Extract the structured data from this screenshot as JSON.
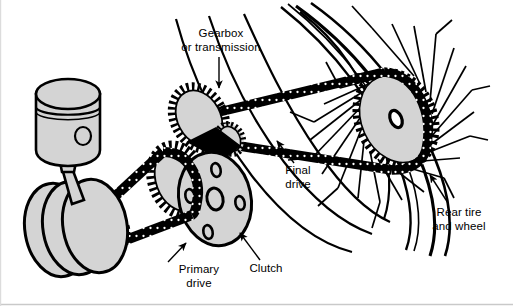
{
  "figure": {
    "background_color": "#ffffff",
    "line_color": "#000000",
    "part_fill_color": "#d4d4d4",
    "chain_color": "#000000"
  },
  "labels": {
    "gearbox": {
      "line1": "Gearbox",
      "line2": "or transmission"
    },
    "final_drive": {
      "line1": "Final",
      "line2": "drive"
    },
    "rear_wheel": {
      "line1": "Rear tire",
      "line2": "and wheel"
    },
    "clutch": {
      "line1": "Clutch"
    },
    "primary_drive": {
      "line1": "Primary",
      "line2": "drive"
    }
  },
  "components": [
    {
      "name": "piston",
      "description": "Engine piston with ring groove and wrist pin hole"
    },
    {
      "name": "connecting-rod",
      "description": "Connecting rod joining piston to crankshaft"
    },
    {
      "name": "flywheel-assembly",
      "description": "Crankshaft flywheels, three stacked discs"
    },
    {
      "name": "engine-sprocket",
      "description": "Small toothed engine output sprocket"
    },
    {
      "name": "primary-chain",
      "description": "Primary drive chain from engine sprocket to clutch"
    },
    {
      "name": "clutch-disc",
      "description": "Clutch plate with centre hole and four bolt holes"
    },
    {
      "name": "clutch-sprocket",
      "description": "Toothed clutch basket sprocket"
    },
    {
      "name": "gearbox-sprocket",
      "description": "Large gearbox input sprocket"
    },
    {
      "name": "gearbox-output-sprocket",
      "description": "Gearbox countershaft output sprocket"
    },
    {
      "name": "final-drive-chain",
      "description": "Final drive chain from gearbox to rear wheel"
    },
    {
      "name": "rear-sprocket",
      "description": "Large rear wheel sprocket"
    },
    {
      "name": "rear-wheel-spokes",
      "description": "Crossed wire spokes of rear wheel"
    },
    {
      "name": "rear-rim",
      "description": "Rear wheel rim arcs"
    },
    {
      "name": "rear-tire",
      "description": "Rear tire outer arcs"
    }
  ]
}
